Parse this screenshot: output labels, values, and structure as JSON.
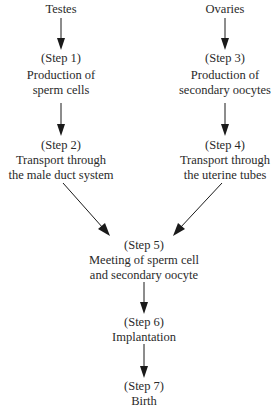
{
  "diagram": {
    "sources": {
      "male": "Testes",
      "female": "Ovaries"
    },
    "steps": [
      {
        "label": "(Step 1)",
        "lines": [
          "Production of",
          "sperm cells"
        ]
      },
      {
        "label": "(Step 2)",
        "lines": [
          "Transport through",
          "the male duct system"
        ]
      },
      {
        "label": "(Step 3)",
        "lines": [
          "Production of",
          "secondary oocytes"
        ]
      },
      {
        "label": "(Step 4)",
        "lines": [
          "Transport through",
          "the uterine tubes"
        ]
      },
      {
        "label": "(Step 5)",
        "lines": [
          "Meeting of sperm cell",
          "and secondary oocyte"
        ]
      },
      {
        "label": "(Step 6)",
        "lines": [
          "Implantation"
        ]
      },
      {
        "label": "(Step 7)",
        "lines": [
          "Birth"
        ]
      }
    ],
    "edges": [
      [
        "Testes",
        "Step 1"
      ],
      [
        "Step 1",
        "Step 2"
      ],
      [
        "Step 2",
        "Step 5"
      ],
      [
        "Ovaries",
        "Step 3"
      ],
      [
        "Step 3",
        "Step 4"
      ],
      [
        "Step 4",
        "Step 5"
      ],
      [
        "Step 5",
        "Step 6"
      ],
      [
        "Step 6",
        "Step 7"
      ]
    ],
    "colors": {
      "text": "#2a2a2a",
      "arrow": "#1a1a1a",
      "background": "#ffffff"
    }
  }
}
